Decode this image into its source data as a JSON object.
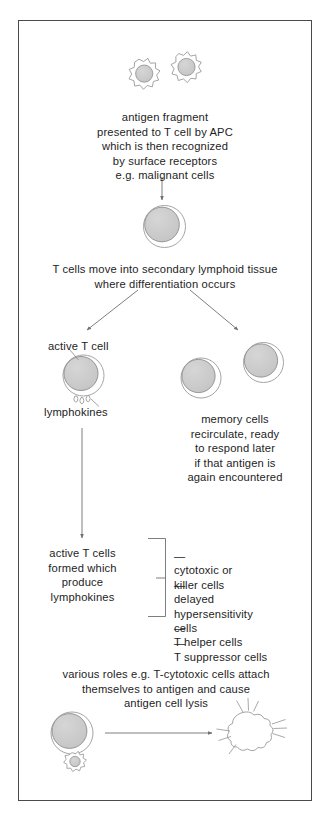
{
  "diagram": {
    "frame": {
      "border_color": "#4a4a4a",
      "background": "#ffffff"
    },
    "colors": {
      "nucleus_fill": "#c9c9c9",
      "nucleus_stroke": "#8d8d8d",
      "membrane_stroke": "#9a9a9a",
      "line_stroke": "#6f6f6f",
      "text": "#1d1d1d"
    },
    "steps": [
      {
        "id": "antigen-presentation",
        "text": "antigen fragment\npresented to T cell by APC\nwhich is then recognized\nby surface receptors\ne.g. malignant cells"
      },
      {
        "id": "differentiation",
        "text": "T cells move into secondary lymphoid tissue\nwhere differentiation occurs"
      },
      {
        "id": "memory-cells",
        "text": "memory cells\nrecirculate, ready\nto respond later\nif that antigen is\nagain encountered"
      },
      {
        "id": "active-t-cells-produce",
        "text": "active T cells\nformed which\nproduce\nlymphokines"
      },
      {
        "id": "various-roles",
        "text": "various roles e.g. T-cytotoxic cells attach\nthemselves to antigen and cause\nantigen cell lysis"
      }
    ],
    "labels": {
      "active_t_cell": "active T cell",
      "lymphokines": "lymphokines"
    },
    "cell_types": [
      {
        "dash": "—",
        "name": "cytotoxic or\nkiller cells"
      },
      {
        "dash": "—",
        "name": "delayed\nhypersensitivity\ncells"
      },
      {
        "dash": "—",
        "name": "T helper cells"
      },
      {
        "dash": "—",
        "name": "T suppressor cells"
      }
    ],
    "figures": {
      "apc_cell_left": "spiky-antigen-presenting-cell-icon",
      "apc_cell_right": "spiky-antigen-presenting-cell-icon",
      "t_cell": "t-cell-icon",
      "active_t_cell": "active-t-cell-icon",
      "memory_cell_left": "memory-cell-icon",
      "memory_cell_right": "memory-cell-icon",
      "cytotoxic_t_cell": "t-cell-icon",
      "attached_antigen": "spiky-antigen-cell-icon",
      "lysed_cell": "lysed-cell-burst-icon",
      "lymphokine_droplets": "lymphokine-droplets-icon"
    }
  }
}
